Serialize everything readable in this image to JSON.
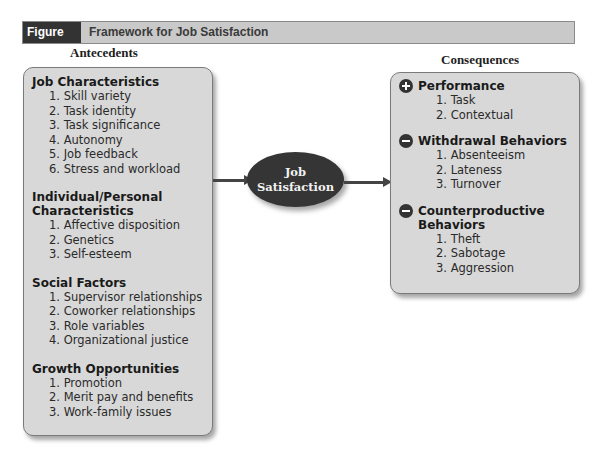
{
  "figure": {
    "label": "Figure 10.3",
    "title": "Framework for Job Satisfaction"
  },
  "antecedents": {
    "heading": "Antecedents",
    "sections": [
      {
        "title": "Job Characteristics",
        "items": [
          "1. Skill variety",
          "2. Task identity",
          "3. Task significance",
          "4. Autonomy",
          "5. Job feedback",
          "6. Stress and workload"
        ]
      },
      {
        "title_line1": "Individual/Personal",
        "title_line2": "Characteristics",
        "items": [
          "1. Affective disposition",
          "2. Genetics",
          "3. Self-esteem"
        ]
      },
      {
        "title": "Social Factors",
        "items": [
          "1. Supervisor relationships",
          "2. Coworker relationships",
          "3. Role variables",
          "4. Organizational justice"
        ]
      },
      {
        "title": "Growth Opportunities",
        "items": [
          "1. Promotion",
          "2. Merit pay and benefits",
          "3. Work-family issues"
        ]
      }
    ]
  },
  "center": {
    "line1": "Job",
    "line2": "Satisfaction"
  },
  "consequences": {
    "heading": "Consequences",
    "sections": [
      {
        "sign": "plus-icon",
        "title": "Performance",
        "items": [
          "1. Task",
          "2. Contextual"
        ]
      },
      {
        "sign": "minus-icon",
        "title": "Withdrawal Behaviors",
        "items": [
          "1. Absenteeism",
          "2. Lateness",
          "3. Turnover"
        ]
      },
      {
        "sign": "minus-icon",
        "title_line1": "Counterproductive",
        "title_line2": "Behaviors",
        "items": [
          "1. Theft",
          "2. Sabotage",
          "3. Aggression"
        ]
      }
    ]
  },
  "colors": {
    "header_dark": "#333333",
    "header_light": "#c9c9c9",
    "box_fill": "#d8d8d8",
    "ellipse_fill": "#353535"
  }
}
